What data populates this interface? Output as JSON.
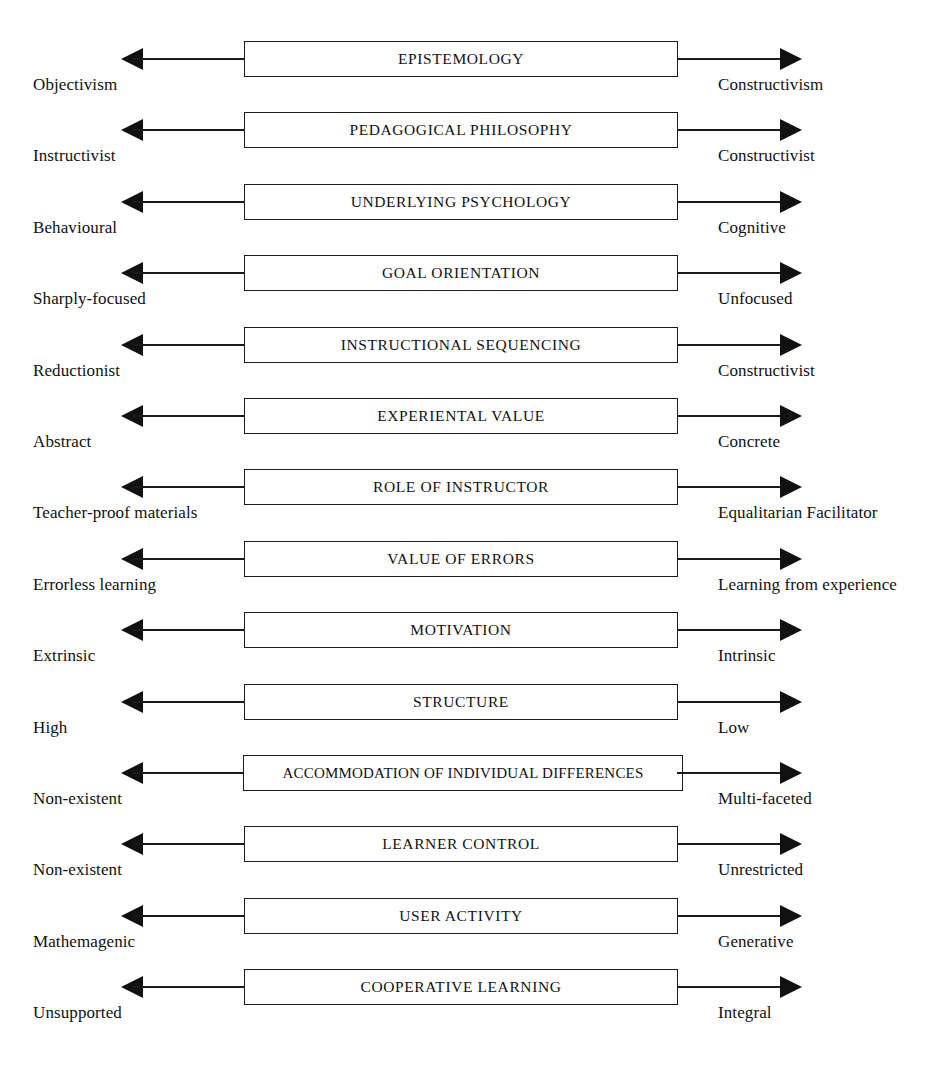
{
  "figure": {
    "kind": "continuum-diagram",
    "orientation": "horizontal-bipolar-scales",
    "row_count": 14,
    "colors": {
      "ink": "#111111",
      "background": "#ffffff",
      "box_border": "#1a1a1a"
    },
    "icons": {
      "left_arrow": "arrow-left-icon",
      "right_arrow": "arrow-right-icon"
    }
  },
  "rows": [
    {
      "dimension": "EPISTEMOLOGY",
      "left_pole": "Objectivism",
      "right_pole": "Constructivism",
      "wide": false
    },
    {
      "dimension": "PEDAGOGICAL PHILOSOPHY",
      "left_pole": "Instructivist",
      "right_pole": "Constructivist",
      "wide": false
    },
    {
      "dimension": "UNDERLYING PSYCHOLOGY",
      "left_pole": "Behavioural",
      "right_pole": "Cognitive",
      "wide": false
    },
    {
      "dimension": "GOAL ORIENTATION",
      "left_pole": "Sharply-focused",
      "right_pole": "Unfocused",
      "wide": false
    },
    {
      "dimension": "INSTRUCTIONAL SEQUENCING",
      "left_pole": "Reductionist",
      "right_pole": "Constructivist",
      "wide": false
    },
    {
      "dimension": "EXPERIENTAL VALUE",
      "left_pole": "Abstract",
      "right_pole": "Concrete",
      "wide": false
    },
    {
      "dimension": "ROLE OF INSTRUCTOR",
      "left_pole": "Teacher-proof materials",
      "right_pole": "Equalitarian Facilitator",
      "wide": false
    },
    {
      "dimension": "VALUE OF ERRORS",
      "left_pole": "Errorless learning",
      "right_pole": "Learning from experience",
      "wide": false
    },
    {
      "dimension": "MOTIVATION",
      "left_pole": "Extrinsic",
      "right_pole": "Intrinsic",
      "wide": false
    },
    {
      "dimension": "STRUCTURE",
      "left_pole": "High",
      "right_pole": "Low",
      "wide": false
    },
    {
      "dimension": "ACCOMMODATION OF INDIVIDUAL DIFFERENCES",
      "left_pole": "Non-existent",
      "right_pole": "Multi-faceted",
      "wide": true
    },
    {
      "dimension": "LEARNER CONTROL",
      "left_pole": "Non-existent",
      "right_pole": "Unrestricted",
      "wide": false
    },
    {
      "dimension": "USER ACTIVITY",
      "left_pole": "Mathemagenic",
      "right_pole": "Generative",
      "wide": false
    },
    {
      "dimension": "COOPERATIVE LEARNING",
      "left_pole": "Unsupported",
      "right_pole": "Integral",
      "wide": false
    }
  ]
}
